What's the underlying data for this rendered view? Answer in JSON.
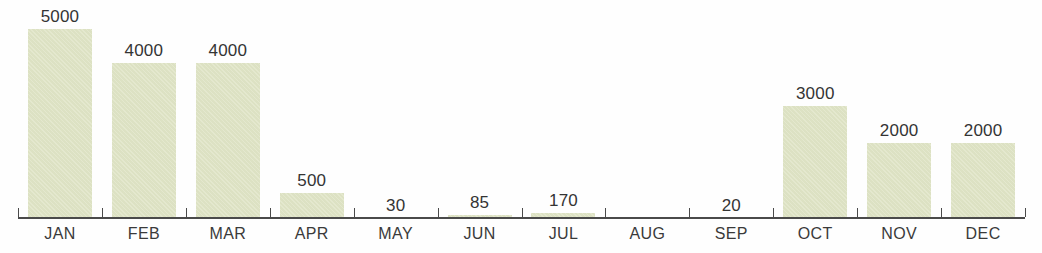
{
  "chart_data": {
    "type": "bar",
    "title": "",
    "subtitle": "",
    "xlabel": "",
    "ylabel": "",
    "categories": [
      "JAN",
      "FEB",
      "MAR",
      "APR",
      "MAY",
      "JUN",
      "JUL",
      "AUG",
      "SEP",
      "OCT",
      "NOV",
      "DEC"
    ],
    "values": [
      5000,
      4000,
      4000,
      500,
      30,
      85,
      170,
      null,
      20,
      3000,
      2000,
      2000
    ],
    "value_labels": [
      "5000",
      "4000",
      "4000",
      "500",
      "30",
      "85",
      "170",
      "",
      "20",
      "3000",
      "2000",
      "2000"
    ],
    "bar_pixel_heights": [
      189,
      155,
      155,
      25,
      0,
      3,
      5,
      0,
      0,
      112,
      75,
      75
    ],
    "series": [
      {
        "name": "",
        "values": [
          5000,
          4000,
          4000,
          500,
          30,
          85,
          170,
          null,
          20,
          3000,
          2000,
          2000
        ]
      }
    ],
    "ylim": [
      0,
      5000
    ],
    "grid": false,
    "legend": false,
    "legend_position": "none",
    "data_labels": true,
    "colors": {
      "bar_fill": "#dfe4c5",
      "axis": "#4a4a4a",
      "value_label_text": "#343434",
      "category_label_text": "#3a3a3a",
      "background": "#fefefe"
    }
  },
  "axis": {
    "tick_count": 13
  }
}
